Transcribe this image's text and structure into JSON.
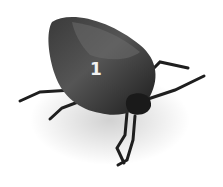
{
  "image": {
    "subject": "stink bug",
    "label": "1",
    "background_color": "#ffffff",
    "body_color": "#2a2a2a"
  }
}
